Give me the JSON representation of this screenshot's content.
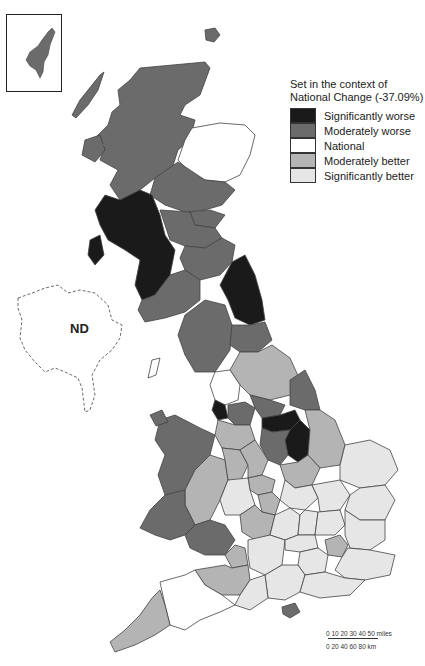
{
  "legend": {
    "title_line1": "Set in the context of",
    "title_line2": "National Change (-37.09%)",
    "items": [
      {
        "label": "Significantly worse",
        "color": "#1a1a1a"
      },
      {
        "label": "Moderately worse",
        "color": "#6b6b6b"
      },
      {
        "label": "National",
        "color": "#ffffff"
      },
      {
        "label": "Moderately better",
        "color": "#b4b4b4"
      },
      {
        "label": "Significantly better",
        "color": "#e6e6e6"
      }
    ]
  },
  "labels": {
    "northern_ireland": "ND"
  },
  "scale_bar": {
    "miles": "0  10 20  30 40 50 miles",
    "km": "0    20   40   60   80 km"
  },
  "colors": {
    "sig_worse": "#1a1a1a",
    "mod_worse": "#6b6b6b",
    "national": "#ffffff",
    "mod_better": "#b4b4b4",
    "sig_better": "#e6e6e6",
    "border": "#444444"
  }
}
